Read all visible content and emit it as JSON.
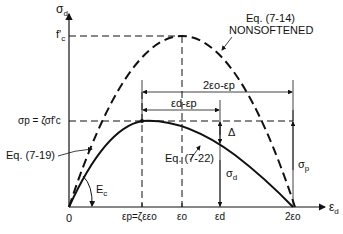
{
  "diagram": {
    "y_axis_label": "σ",
    "y_axis_sub": "d",
    "x_axis_label": "ε",
    "x_axis_sub": "d",
    "fc_label": "f'",
    "fc_sub": "c",
    "sigma_p_label": "σp = ζσf'c",
    "origin_label": "0",
    "ec_label": "E",
    "ec_sub": "c",
    "x_ticks": {
      "eps_p": "εp=ζεεo",
      "eps_o": "εo",
      "eps_d": "εd",
      "two_eps_o": "2εo"
    },
    "curve_nonsoftened_eq": "Eq. (7-14)",
    "curve_nonsoftened_name": "NONSOFTENED",
    "curve_719_eq": "Eq. (7-19)",
    "curve_722_eq": "Eq. (7-22)",
    "dim_2eo_minus_ep": "2εo-εp",
    "dim_ed_minus_ep": "εd-εp",
    "delta_label": "Δ",
    "sigma_d_label": "σ",
    "sigma_d_sub": "d",
    "sigma_p_right_label": "σ",
    "sigma_p_right_sub": "p"
  }
}
